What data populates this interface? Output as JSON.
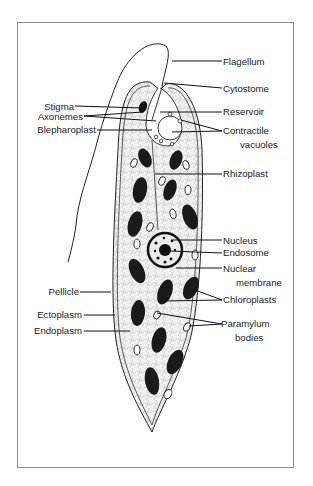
{
  "diagram": {
    "labels_right": [
      {
        "id": "flagellum",
        "text": "Flagellum"
      },
      {
        "id": "cytostome",
        "text": "Cytostome"
      },
      {
        "id": "reservoir",
        "text": "Reservoir"
      },
      {
        "id": "contractile-vacuoles",
        "text": "Contractile",
        "text2": "vacuoles"
      },
      {
        "id": "rhizoplast",
        "text": "Rhizoplast"
      },
      {
        "id": "nucleus",
        "text": "Nucleus"
      },
      {
        "id": "endosome",
        "text": "Endosome"
      },
      {
        "id": "nuclear-membrane",
        "text": "Nuclear",
        "text2": "membrane"
      },
      {
        "id": "chloroplasts",
        "text": "Chloroplasts"
      },
      {
        "id": "paramylum-bodies",
        "text": "Paramylum",
        "text2": "bodies"
      }
    ],
    "labels_left": [
      {
        "id": "stigma",
        "text": "Stigma"
      },
      {
        "id": "axonemes",
        "text": "Axonemes"
      },
      {
        "id": "blepharoplast",
        "text": "Blepharoplast"
      },
      {
        "id": "pellicle",
        "text": "Pellicle"
      },
      {
        "id": "ectoplasm",
        "text": "Ectoplasm"
      },
      {
        "id": "endoplasm",
        "text": "Endoplasm"
      }
    ]
  }
}
